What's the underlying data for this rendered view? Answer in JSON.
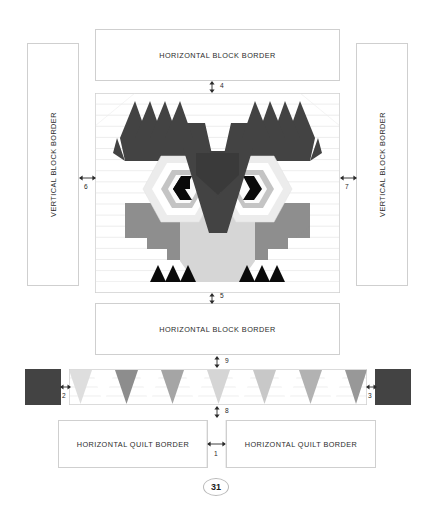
{
  "document": {
    "page_number": "31",
    "type": "quilt pattern assembly diagram",
    "subject": "Owl quilt block layout"
  },
  "labels": {
    "horizontal_block_border": "HORIZONTAL BLOCK BORDER",
    "vertical_block_border": "VERTICAL BLOCK BORDER",
    "horizontal_quilt_border": "HORIZONTAL QUILT BORDER"
  },
  "borders": {
    "top_horizontal_block_border": "HORIZONTAL BLOCK BORDER",
    "bottom_horizontal_block_border": "HORIZONTAL BLOCK BORDER",
    "left_vertical_block_border": "VERTICAL BLOCK BORDER",
    "right_vertical_block_border": "VERTICAL BLOCK BORDER",
    "left_horizontal_quilt_border": "HORIZONTAL QUILT BORDER",
    "right_horizontal_quilt_border": "HORIZONTAL QUILT BORDER"
  },
  "dimensions": [
    {
      "id": "1",
      "label": "1",
      "orientation": "horizontal",
      "between": "left and right horizontal quilt borders"
    },
    {
      "id": "2",
      "label": "2",
      "orientation": "horizontal",
      "between": "left corner square and triangle sashing strip"
    },
    {
      "id": "3",
      "label": "3",
      "orientation": "horizontal",
      "between": "triangle sashing strip and right corner square"
    },
    {
      "id": "4",
      "label": "4",
      "orientation": "vertical",
      "between": "top horizontal block border and owl block"
    },
    {
      "id": "5",
      "label": "5",
      "orientation": "vertical",
      "between": "owl block and bottom horizontal block border"
    },
    {
      "id": "6",
      "label": "6",
      "orientation": "horizontal",
      "between": "left vertical block border and owl block"
    },
    {
      "id": "7",
      "label": "7",
      "orientation": "horizontal",
      "between": "owl block and right vertical block border"
    },
    {
      "id": "8",
      "label": "8",
      "orientation": "vertical",
      "between": "triangle sashing strip and horizontal quilt borders"
    },
    {
      "id": "9",
      "label": "9",
      "orientation": "vertical",
      "between": "bottom horizontal block border and triangle sashing strip"
    }
  ],
  "colors": {
    "outline": "#cfcfcf",
    "dark_charcoal": "#434343",
    "black": "#0a0a0a",
    "medium_gray": "#8c8c8c",
    "mid_light_gray": "#b5b5b5",
    "light_gray": "#d8d8d8",
    "very_light_gray": "#ededed",
    "white": "#ffffff",
    "text": "#2b2b2b",
    "row_line": "#e3e3e3"
  },
  "owl_block": {
    "description": "Pieced owl face block with ear tufts, two hexagon eyes with black pupils, a V-shaped dark brow/beak, light chest and gray wings with triangular talons",
    "elements": [
      "left ear tuft",
      "right ear tuft",
      "left eye hexagon",
      "right eye hexagon",
      "left pupil",
      "right pupil",
      "beak",
      "brow-v",
      "chest",
      "left wing",
      "right wing",
      "left talons",
      "right talons"
    ],
    "rows": 18
  },
  "sashing_strip": {
    "description": "Pieced triangle sashing strip (flying geese / triangle row)",
    "triangle_count": 13,
    "triangle_shades": [
      "#dcdcdc",
      "#ffffff",
      "#8f8f8f",
      "#ffffff",
      "#a8a8a8",
      "#ffffff",
      "#d5d5d5",
      "#ffffff",
      "#cacaca",
      "#ffffff",
      "#b3b3b3",
      "#ffffff",
      "#9c9c9c",
      "#ffffff",
      "#c6c6c6"
    ],
    "corner_square_color": "#434343",
    "corner_squares": 2
  }
}
